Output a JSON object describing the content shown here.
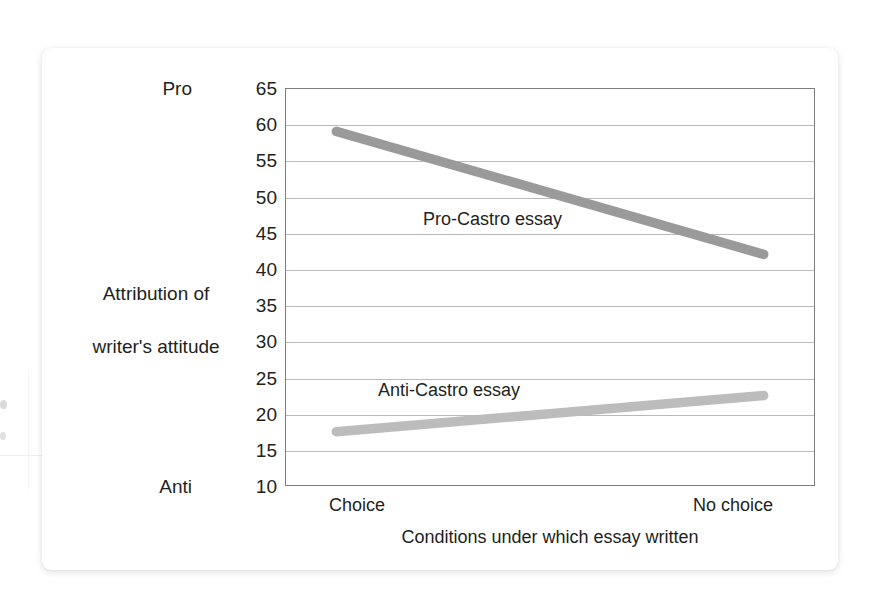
{
  "chart_data": {
    "type": "line",
    "title": "",
    "xlabel": "Conditions under which essay written",
    "ylabel": "Attribution of\nwriter's attitude",
    "categories": [
      "Choice",
      "No choice"
    ],
    "x": [
      0,
      1
    ],
    "xlim": [
      -0.12,
      1.12
    ],
    "ylim": [
      10,
      65
    ],
    "ytick_labels": [
      "65",
      "60",
      "55",
      "50",
      "45",
      "40",
      "35",
      "30",
      "25",
      "20",
      "15",
      "10"
    ],
    "yticks": [
      65,
      60,
      55,
      50,
      45,
      40,
      35,
      30,
      25,
      20,
      15,
      10
    ],
    "y_pole_high": "Pro",
    "y_pole_low": "Anti",
    "grid": true,
    "legend_position": "inline-annotation",
    "series": [
      {
        "name": "Pro-Castro essay",
        "values": [
          59,
          42
        ],
        "color": "#9a9a9a",
        "annotation": "Pro-Castro essay"
      },
      {
        "name": "Anti-Castro essay",
        "values": [
          17.5,
          22.5
        ],
        "color": "#bcbcbc",
        "annotation": "Anti-Castro essay"
      }
    ]
  },
  "axes": {
    "y_title_line1": "Attribution of",
    "y_title_line2": "writer's attitude",
    "y_pole_top": "Pro",
    "y_pole_bottom": "Anti",
    "ticks": [
      {
        "label": "65",
        "value": 65
      },
      {
        "label": "60",
        "value": 60
      },
      {
        "label": "55",
        "value": 55
      },
      {
        "label": "50",
        "value": 50
      },
      {
        "label": "45",
        "value": 45
      },
      {
        "label": "40",
        "value": 40
      },
      {
        "label": "35",
        "value": 35
      },
      {
        "label": "30",
        "value": 30
      },
      {
        "label": "25",
        "value": 25
      },
      {
        "label": "20",
        "value": 20
      },
      {
        "label": "15",
        "value": 15
      },
      {
        "label": "10",
        "value": 10
      }
    ],
    "x_tick_left": "Choice",
    "x_tick_right": "No choice",
    "x_title": "Conditions under which essay written"
  },
  "annotations": {
    "pro_series": "Pro-Castro essay",
    "anti_series": "Anti-Castro essay"
  },
  "colors": {
    "pro_line": "#9a9a9a",
    "anti_line": "#bcbcbc",
    "gridline": "#b9b9b9",
    "frame": "#7d7d7d",
    "text": "#231f20",
    "card": "#ffffff",
    "background": "#ffffff"
  }
}
